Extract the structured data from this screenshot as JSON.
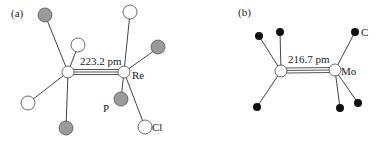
{
  "panels": [
    {
      "label": "(a)",
      "bond_length": "223.2 pm",
      "metal_label": "Re",
      "ligand_labels": {
        "P": "P",
        "Cl": "Cl"
      }
    },
    {
      "label": "(b)",
      "bond_length": "216.7 pm",
      "metal_label": "Mo",
      "ligand_labels": {
        "C": "C"
      }
    }
  ],
  "colors": {
    "white_atom": "#ffffff",
    "gray_atom": "#9a9a9a",
    "black_atom": "#111111",
    "bond": "#444444"
  }
}
